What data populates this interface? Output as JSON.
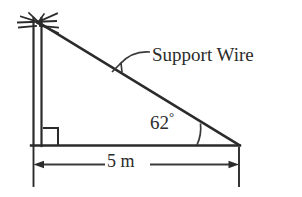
{
  "figure": {
    "type": "geometry-diagram",
    "background_color": "#ffffff",
    "stroke_color": "#2b2b2b",
    "labels": {
      "support_wire": "Support Wire",
      "angle_value": "62",
      "degree_symbol": "°",
      "base_dimension": "5 m"
    },
    "geometry": {
      "pole_top_x": 38,
      "pole_top_y": 22,
      "pole_base_x": 33,
      "pole_base_y": 145,
      "ground_right_x": 238,
      "ground_right_y": 145,
      "angle_degrees": 62,
      "base_length": "5 m",
      "right_angle_marker": true
    },
    "icons": {
      "utility_pole": "utility-pole-icon",
      "right_angle": "right-angle-marker-icon",
      "angle_arc": "angle-arc-icon",
      "leader": "leader-line-icon",
      "dimension": "dimension-line-icon"
    }
  }
}
